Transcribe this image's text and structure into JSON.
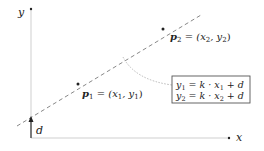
{
  "diagram": {
    "type": "linear-function-two-points",
    "axes": {
      "x_label": "x",
      "y_label": "y"
    },
    "line": {
      "style": "dashed",
      "description": "straight line through p1 and p2"
    },
    "points": [
      {
        "id": "p1",
        "symbol": "p",
        "subscript": "1",
        "equals": "=",
        "coords": "(x",
        "coord_x_sub": "1",
        "sep": ", y",
        "coord_y_sub": "1",
        "close": ")"
      },
      {
        "id": "p2",
        "symbol": "p",
        "subscript": "2",
        "equals": "=",
        "coords": "(x",
        "coord_x_sub": "2",
        "sep": ", y",
        "coord_y_sub": "2",
        "close": ")"
      }
    ],
    "intercept": {
      "label": "d"
    },
    "equations": [
      {
        "lhs": "y",
        "lhs_sub": "1",
        "rhs_a": " = k · x",
        "rhs_sub": "1",
        "rhs_b": " + d"
      },
      {
        "lhs": "y",
        "lhs_sub": "2",
        "rhs_a": " = k · x",
        "rhs_sub": "2",
        "rhs_b": " + d"
      }
    ],
    "colors": {
      "axis": "#cfcfcf",
      "line": "#888888",
      "text": "#222222",
      "box_border": "#555555",
      "connector": "#b0b0b0"
    }
  }
}
